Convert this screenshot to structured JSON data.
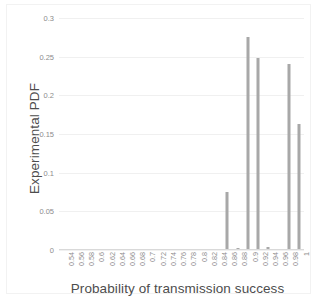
{
  "chart_data": {
    "type": "bar",
    "title": "",
    "xlabel": "Probability of transmission success",
    "ylabel": "Experimental PDF",
    "categories": [
      "0.54",
      "0.56",
      "0.58",
      "0.6",
      "0.62",
      "0.64",
      "0.66",
      "0.68",
      "0.7",
      "0.72",
      "0.74",
      "0.76",
      "0.78",
      "0.8",
      "0.82",
      "0.84",
      "0.86",
      "0.88",
      "0.9",
      "0.92",
      "0.94",
      "0.96",
      "0.98",
      "1"
    ],
    "values": [
      0,
      0,
      0,
      0,
      0,
      0,
      0,
      0,
      0,
      0,
      0,
      0,
      0,
      0,
      0,
      0.001,
      0.075,
      0.003,
      0.276,
      0.248,
      0.004,
      0,
      0.241,
      0.163
    ],
    "ylim": [
      0,
      0.3
    ],
    "yticks": [
      "0",
      "0.05",
      "0.1",
      "0.15",
      "0.2",
      "0.25",
      "0.3"
    ],
    "ytick_values": [
      0,
      0.05,
      0.1,
      0.15,
      0.2,
      0.25,
      0.3
    ],
    "grid": true,
    "legend": null,
    "bar_color": "#a8a8a8",
    "grid_color": "#f0f0f0",
    "text_color": "#4d4d4d",
    "tick_color": "#8c8c8c",
    "background": "#ffffff"
  }
}
